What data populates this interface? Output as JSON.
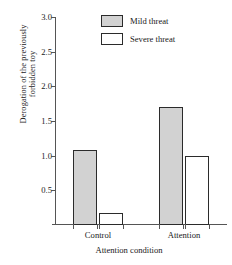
{
  "chart_data": {
    "type": "bar",
    "title": "",
    "xlabel": "Attention condition",
    "ylabel": "Derogation of the previously forbidden toy",
    "ylabel_lines": [
      "Derogation of the previously",
      "forbidden toy"
    ],
    "categories": [
      "Control",
      "Attention"
    ],
    "series": [
      {
        "name": "Mild threat",
        "values": [
          1.08,
          1.7
        ],
        "fill": "#d2d2d2",
        "stroke": "#2b2b2b"
      },
      {
        "name": "Severe threat",
        "values": [
          0.18,
          1.0
        ],
        "fill": "#ffffff",
        "stroke": "#2b2b2b"
      }
    ],
    "ylim": [
      0,
      3.0
    ],
    "ytick_values": [
      3.0,
      2.5,
      2.0,
      1.5,
      1.0,
      0.5
    ],
    "ytick_labels": [
      "3.0",
      "2.5",
      "2.0",
      "1.5",
      "1.0",
      "0.5"
    ],
    "grid": false,
    "legend_position": "top-right"
  },
  "legend": {
    "entries": [
      {
        "label": "Mild threat"
      },
      {
        "label": "Severe threat"
      }
    ]
  }
}
